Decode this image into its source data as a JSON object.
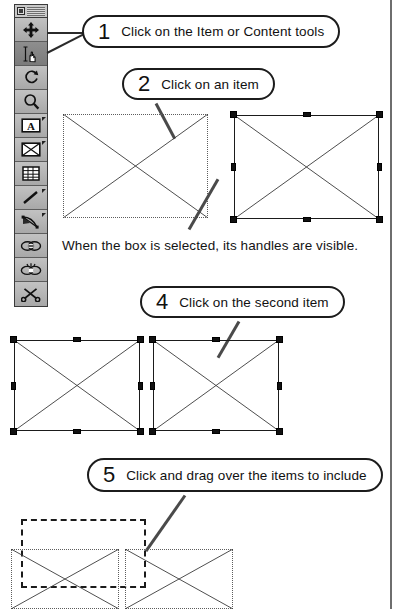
{
  "page": {
    "background": "#ffffff",
    "rule_color": "#6e6e6e"
  },
  "tool_palette": {
    "name": "Tools palette",
    "title_close_label": "",
    "tools": [
      {
        "id": "item-tool",
        "icon": "four-way-move-icon",
        "label": "Item tool",
        "selected": false,
        "has_flag": false
      },
      {
        "id": "content-tool",
        "icon": "hand-text-icon",
        "label": "Content tool",
        "selected": true,
        "has_flag": false
      },
      {
        "id": "rotation-tool",
        "icon": "rotation-icon",
        "label": "Rotation tool",
        "selected": false,
        "has_flag": false
      },
      {
        "id": "zoom-tool",
        "icon": "magnifier-icon",
        "label": "Zoom tool",
        "selected": false,
        "has_flag": false
      },
      {
        "id": "text-box-tool",
        "icon": "text-box-a-icon",
        "label": "Text Box tool",
        "selected": false,
        "has_flag": true
      },
      {
        "id": "picture-box-tool",
        "icon": "picture-box-x-icon",
        "label": "Picture Box tool",
        "selected": false,
        "has_flag": true
      },
      {
        "id": "table-tool",
        "icon": "table-grid-icon",
        "label": "Table tool",
        "selected": false,
        "has_flag": false
      },
      {
        "id": "line-tool",
        "icon": "diagonal-line-icon",
        "label": "Line tool",
        "selected": false,
        "has_flag": true
      },
      {
        "id": "text-path-tool",
        "icon": "bezier-text-path-icon",
        "label": "Text-Path tool",
        "selected": false,
        "has_flag": true
      },
      {
        "id": "linking-tool",
        "icon": "chain-link-icon",
        "label": "Linking tool",
        "selected": false,
        "has_flag": false
      },
      {
        "id": "unlinking-tool",
        "icon": "chain-break-icon",
        "label": "Unlinking tool",
        "selected": false,
        "has_flag": false
      },
      {
        "id": "scissors-tool",
        "icon": "scissors-icon",
        "label": "Scissors tool",
        "selected": false,
        "has_flag": false
      }
    ]
  },
  "callouts": [
    {
      "number": "1",
      "text": "Click on the Item or Content tools"
    },
    {
      "number": "2",
      "text": "Click on an item"
    },
    {
      "number": "4",
      "text": "Click on the second item"
    },
    {
      "number": "5",
      "text": "Click and drag over the items to include"
    }
  ],
  "caption": {
    "text": "When the box is selected, its handles are visible."
  },
  "figures": {
    "step2": {
      "unselected_box": {
        "state": "unselected",
        "border": "dotted"
      },
      "selected_box": {
        "state": "selected",
        "border": "solid",
        "handles": 8
      }
    },
    "step4": {
      "first_box": {
        "state": "selected",
        "border": "solid",
        "handles": 8
      },
      "second_box": {
        "state": "selected",
        "border": "solid",
        "handles": 8
      }
    },
    "step5": {
      "marquee": {
        "style": "dashed",
        "label": "drag marquee"
      },
      "left_box": {
        "state": "unselected",
        "border": "dotted"
      },
      "right_box": {
        "state": "unselected",
        "border": "dotted"
      }
    }
  }
}
